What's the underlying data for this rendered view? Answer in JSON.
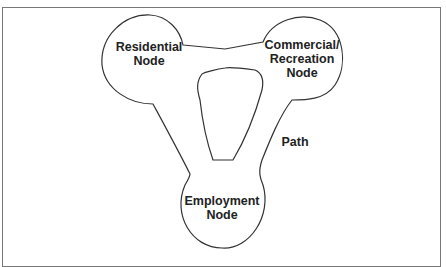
{
  "diagram": {
    "nodes": [
      {
        "id": "residential",
        "label_line1": "Residential",
        "label_line2": "Node"
      },
      {
        "id": "commercial",
        "label_line1": "Commercial/",
        "label_line2": "Recreation",
        "label_line3": "Node"
      },
      {
        "id": "employment",
        "label_line1": "Employment",
        "label_line2": "Node"
      }
    ],
    "path_label": "Path",
    "colors": {
      "stroke": "#333333",
      "frame": "#777777",
      "text": "#222222",
      "background": "#ffffff"
    }
  }
}
